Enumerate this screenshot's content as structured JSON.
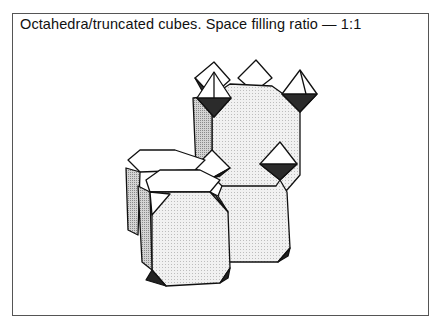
{
  "figure": {
    "title": "Octahedra/truncated cubes. Space filling ratio — 1:1",
    "colors": {
      "border": "#555555",
      "edge": "#111111",
      "face_light": "#ececec",
      "face_white": "#ffffff",
      "face_mid": "#c4c4c4",
      "face_dark": "#2a2a2a"
    }
  }
}
